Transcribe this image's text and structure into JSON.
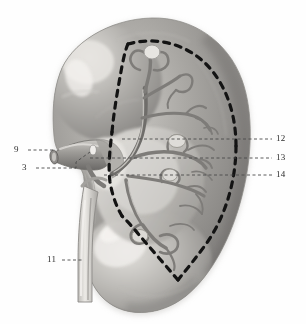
{
  "figure": {
    "view": "anterior surface with hilum and renal vessels",
    "style": "grayscale halftone anatomical illustration",
    "background_color": "#fefefe",
    "organ_fill_color": "#9a9a9a",
    "organ_highlight_color": "#d8d6d2",
    "organ_shadow_color": "#6e6c6a",
    "vessel_color": "#8d8b88",
    "dashed_boundary_color": "#111111",
    "leader_line_color": "#4a4a4a",
    "label_text_color": "#2b2b2b"
  },
  "labels": [
    {
      "id": "label-9",
      "number": "9",
      "text_x": 18,
      "text_y": 152,
      "leader": "dashed-horizontal",
      "target": "renal-vessel-stump-left"
    },
    {
      "id": "label-3",
      "number": "3",
      "text_x": 25,
      "text_y": 170,
      "leader": "dashed-elbow-up-right",
      "target": "renal-vessel-branch"
    },
    {
      "id": "label-11",
      "number": "11",
      "text_x": 50,
      "text_y": 262,
      "leader": "dashed-horizontal",
      "target": "ureter"
    },
    {
      "id": "label-12",
      "number": "12",
      "text_x": 276,
      "text_y": 134,
      "leader": "dashed-horizontal",
      "target": "superior-segmental-branch"
    },
    {
      "id": "label-13",
      "number": "13",
      "text_x": 276,
      "text_y": 153,
      "leader": "dashed-horizontal",
      "target": "anterior-segmental-branch"
    },
    {
      "id": "label-14",
      "number": "14",
      "text_x": 276,
      "text_y": 170,
      "leader": "dashed-horizontal",
      "target": "inferior-segmental-branch"
    }
  ]
}
